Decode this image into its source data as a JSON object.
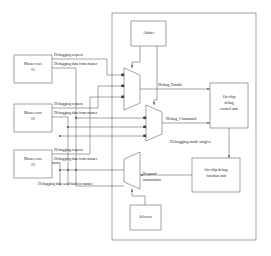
{
  "diagram": {
    "type": "block-diagram",
    "line_color": "#555555",
    "box_fill": "#ffffff",
    "text_color": "#2f2f2f"
  },
  "chip_boundary": {
    "name": "chip-boundary"
  },
  "masters": [
    {
      "label_line1": "Master core",
      "label_line2": "#1",
      "request_label": "Debugging request",
      "data_label": "Debugging data from master"
    },
    {
      "label_line1": "Master core",
      "label_line2": "#2",
      "request_label": "Debugging request",
      "data_label": "Debugging data from master"
    },
    {
      "label_line1": "Master core",
      "label_line2": "#3",
      "request_label": "Debugging request",
      "data_label": "Debugging data from master"
    }
  ],
  "blocks": {
    "arbiter": {
      "label": "Arbiter"
    },
    "debug_control_unit": {
      "line1": "On-chip",
      "line2": "debug",
      "line3": "control unit"
    },
    "debug_function_unit": {
      "line1": "On-chip debug",
      "line2": "function unit"
    },
    "selector": {
      "label": "Selector"
    },
    "mux_enable": {
      "name": "enable-mux"
    },
    "mux_command": {
      "name": "command-mux"
    },
    "mux_respond": {
      "name": "respond-mux"
    }
  },
  "signals": {
    "debug_enable": "Debug_Enable",
    "debug_command": "Debug_Command",
    "debug_mode_signals": "Debugging mode singles",
    "respond_info_line1": "Respond",
    "respond_info_line2": "information",
    "data_send_back": "Debugging data send back to master"
  }
}
